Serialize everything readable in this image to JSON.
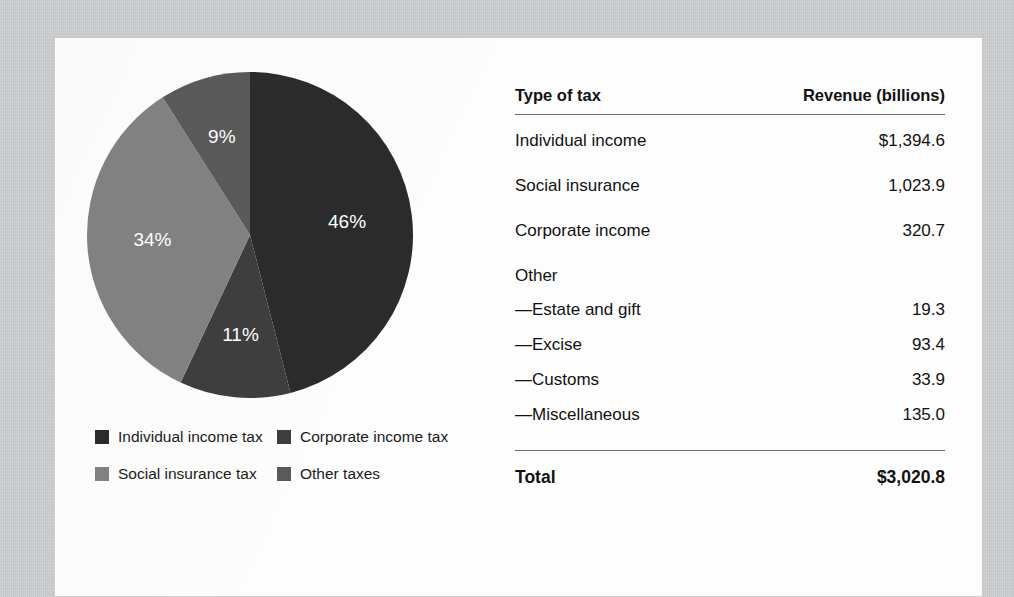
{
  "figure": {
    "background_color": "#c9cacb",
    "card_color": "#fdfdfd"
  },
  "chart_data": {
    "type": "pie",
    "title": "",
    "categories": [
      "Individual income tax",
      "Corporate income tax",
      "Social insurance tax",
      "Other taxes"
    ],
    "values": [
      46,
      11,
      34,
      9
    ],
    "value_labels": [
      "46%",
      "11%",
      "34%",
      "9%"
    ],
    "units": "percent",
    "legend_position": "bottom-left",
    "colors": [
      "#2b2b2b",
      "#3e3e3e",
      "#828282",
      "#5a5a5a"
    ],
    "start_angle_deg": 0,
    "direction": "clockwise",
    "slices": [
      {
        "label": "Individual income tax",
        "percent": 46,
        "display": "46%",
        "color": "#2b2b2b"
      },
      {
        "label": "Corporate income tax",
        "percent": 11,
        "display": "11%",
        "color": "#3e3e3e"
      },
      {
        "label": "Social insurance tax",
        "percent": 34,
        "display": "34%",
        "color": "#828282"
      },
      {
        "label": "Other taxes",
        "percent": 9,
        "display": "9%",
        "color": "#5a5a5a"
      }
    ]
  },
  "legend": {
    "items": [
      {
        "label": "Individual income tax",
        "color": "#2b2b2b"
      },
      {
        "label": "Corporate income tax",
        "color": "#3e3e3e"
      },
      {
        "label": "Social insurance tax",
        "color": "#828282"
      },
      {
        "label": "Other taxes",
        "color": "#5a5a5a"
      }
    ]
  },
  "table": {
    "headers": {
      "type": "Type of tax",
      "revenue": "Revenue (billions)"
    },
    "rows": [
      {
        "label": "Individual income",
        "value": "$1,394.6",
        "kind": "major"
      },
      {
        "label": "Social insurance",
        "value": "1,023.9",
        "kind": "major"
      },
      {
        "label": "Corporate income",
        "value": "320.7",
        "kind": "major"
      },
      {
        "label": "Other",
        "value": "",
        "kind": "group"
      },
      {
        "label": "—Estate and gift",
        "value": "19.3",
        "kind": "sub"
      },
      {
        "label": "—Excise",
        "value": "93.4",
        "kind": "sub"
      },
      {
        "label": "—Customs",
        "value": "33.9",
        "kind": "sub"
      },
      {
        "label": "—Miscellaneous",
        "value": "135.0",
        "kind": "sub"
      }
    ],
    "total": {
      "label": "Total",
      "value": "$3,020.8"
    }
  }
}
